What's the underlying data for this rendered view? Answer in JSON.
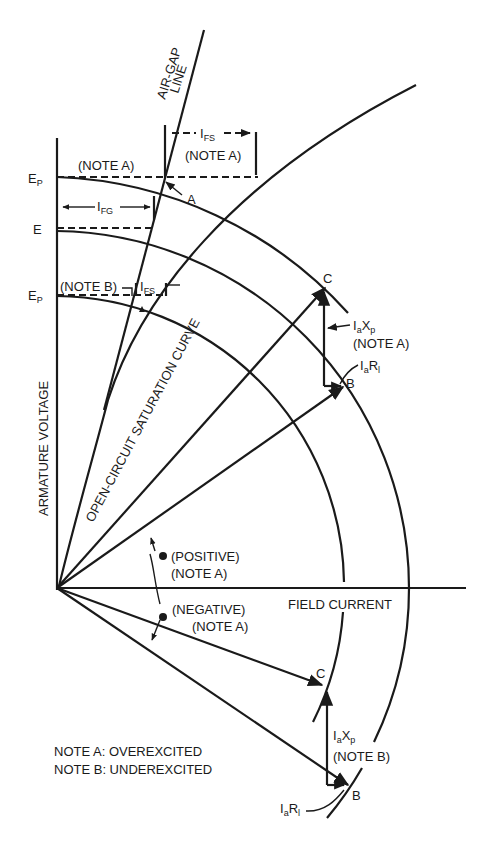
{
  "diagram": {
    "axes": {
      "y_label": "ARMATURE VOLTAGE",
      "x_label": "FIELD CURRENT"
    },
    "voltage_levels": {
      "ep_top": "E",
      "ep_top_sub": "P",
      "e": "E",
      "ep_bottom": "E",
      "ep_bottom_sub": "P"
    },
    "curves": {
      "air_gap_line_1": "AIR-GAP",
      "air_gap_line_2": "LINE",
      "saturation_curve": "OPEN-CIRCUIT  SATURATION  CURVE"
    },
    "dimensions": {
      "ifs_top": "I",
      "ifs_top_sub": "FS",
      "ifs_top_note": "(NOTE A)",
      "ifg": "I",
      "ifg_sub": "FG",
      "ifs_bottom": "I",
      "ifs_bottom_sub": "FS",
      "note_a_top": "(NOTE A)",
      "note_b_left": "(NOTE B)"
    },
    "points": {
      "a": "A",
      "c_top": "C",
      "b_top": "B",
      "c_bottom": "C",
      "b_bottom": "B"
    },
    "phasors": {
      "top_iaxp": "I",
      "top_iaxp_a": "a",
      "top_iaxp_x": "X",
      "top_iaxp_p": "p",
      "top_iaxp_note": "(NOTE A)",
      "top_iarl": "I",
      "top_iarl_a": "a",
      "top_iarl_r": "R",
      "top_iarl_l": "l",
      "bottom_iaxp": "I",
      "bottom_iaxp_a": "a",
      "bottom_iaxp_x": "X",
      "bottom_iaxp_p": "p",
      "bottom_iaxp_note": "(NOTE B)",
      "bottom_iarl": "I",
      "bottom_iarl_a": "a",
      "bottom_iarl_r": "R",
      "bottom_iarl_l": "l"
    },
    "angle_labels": {
      "positive": "(POSITIVE)",
      "positive_note": "(NOTE A)",
      "negative": "(NEGATIVE)",
      "negative_note": "(NOTE A)"
    },
    "legend": {
      "note_a": "NOTE A: OVEREXCITED",
      "note_b": "NOTE B: UNDEREXCITED"
    }
  }
}
